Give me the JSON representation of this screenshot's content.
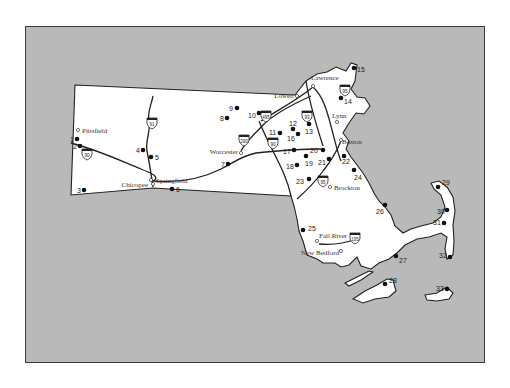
{
  "map": {
    "title": "Massachusetts",
    "colors": {
      "water": "#b9b9b9",
      "land": "#ffffff",
      "frame": "#3a3a3a",
      "marker": "#111111"
    },
    "cities": [
      {
        "name": "Pittsfield",
        "x": 77,
        "y": 129,
        "lx": 81,
        "ly": 132,
        "anchor": "start"
      },
      {
        "name": "Chicopee",
        "x": 150,
        "y": 179,
        "lx": 147,
        "ly": 186,
        "anchor": "end"
      },
      {
        "name": "Springfield",
        "x": 152,
        "y": 183,
        "lx": 155,
        "ly": 182,
        "anchor": "start"
      },
      {
        "name": "Worcester",
        "x": 240,
        "y": 152,
        "lx": 237,
        "ly": 153,
        "anchor": "end"
      },
      {
        "name": "Lowell",
        "x": 296,
        "y": 95,
        "lx": 293,
        "ly": 97,
        "anchor": "end"
      },
      {
        "name": "Lawrence",
        "x": 312,
        "y": 85,
        "lx": 310,
        "ly": 79,
        "anchor": "start"
      },
      {
        "name": "Lynn",
        "x": 336,
        "y": 121,
        "lx": 331,
        "ly": 117,
        "anchor": "start"
      },
      {
        "name": "Boston",
        "x": 340,
        "y": 139,
        "lx": 341,
        "ly": 143,
        "anchor": "start"
      },
      {
        "name": "Brockton",
        "x": 329,
        "y": 186,
        "lx": 333,
        "ly": 189,
        "anchor": "start"
      },
      {
        "name": "Fall River",
        "x": 316,
        "y": 240,
        "lx": 318,
        "ly": 237,
        "anchor": "start"
      },
      {
        "name": "New Bedford",
        "x": 340,
        "y": 250,
        "lx": 338,
        "ly": 254,
        "anchor": "end"
      }
    ],
    "sites": [
      {
        "n": "1",
        "x": 76,
        "y": 138,
        "lx": 69,
        "ly": 141
      },
      {
        "n": "2",
        "x": 79,
        "y": 145,
        "lx": 72,
        "ly": 148
      },
      {
        "n": "3",
        "x": 83,
        "y": 189,
        "lx": 76,
        "ly": 192
      },
      {
        "n": "4",
        "x": 142,
        "y": 149,
        "lx": 135,
        "ly": 152
      },
      {
        "n": "5",
        "x": 150,
        "y": 156,
        "lx": 154,
        "ly": 159
      },
      {
        "n": "6",
        "x": 171,
        "y": 188,
        "lx": 175,
        "ly": 191
      },
      {
        "n": "7",
        "x": 227,
        "y": 163,
        "lx": 220,
        "ly": 166
      },
      {
        "n": "8",
        "x": 226,
        "y": 117,
        "lx": 219,
        "ly": 120
      },
      {
        "n": "9",
        "x": 236,
        "y": 107,
        "lx": 228,
        "ly": 110
      },
      {
        "n": "10",
        "x": 258,
        "y": 112,
        "lx": 247,
        "ly": 117
      },
      {
        "n": "11",
        "x": 279,
        "y": 132,
        "lx": 268,
        "ly": 134
      },
      {
        "n": "12",
        "x": 292,
        "y": 128,
        "lx": 288,
        "ly": 125
      },
      {
        "n": "13",
        "x": 308,
        "y": 123,
        "lx": 304,
        "ly": 133
      },
      {
        "n": "14",
        "x": 340,
        "y": 97,
        "lx": 343,
        "ly": 103
      },
      {
        "n": "15",
        "x": 353,
        "y": 67,
        "lx": 356,
        "ly": 71
      },
      {
        "n": "16",
        "x": 297,
        "y": 133,
        "lx": 286,
        "ly": 140
      },
      {
        "n": "17",
        "x": 293,
        "y": 149,
        "lx": 282,
        "ly": 153
      },
      {
        "n": "18",
        "x": 296,
        "y": 164,
        "lx": 285,
        "ly": 168
      },
      {
        "n": "19",
        "x": 305,
        "y": 155,
        "lx": 304,
        "ly": 165
      },
      {
        "n": "20",
        "x": 322,
        "y": 149,
        "lx": 309,
        "ly": 152
      },
      {
        "n": "21",
        "x": 328,
        "y": 158,
        "lx": 317,
        "ly": 164
      },
      {
        "n": "22",
        "x": 343,
        "y": 155,
        "lx": 341,
        "ly": 163
      },
      {
        "n": "23",
        "x": 308,
        "y": 178,
        "lx": 295,
        "ly": 183
      },
      {
        "n": "24",
        "x": 353,
        "y": 169,
        "lx": 353,
        "ly": 179
      },
      {
        "n": "25",
        "x": 302,
        "y": 229,
        "lx": 307,
        "ly": 230
      },
      {
        "n": "26",
        "x": 384,
        "y": 204,
        "lx": 375,
        "ly": 213
      },
      {
        "n": "27",
        "x": 395,
        "y": 255,
        "lx": 398,
        "ly": 262
      },
      {
        "n": "28",
        "x": 384,
        "y": 283,
        "lx": 388,
        "ly": 282
      },
      {
        "n": "29",
        "x": 437,
        "y": 186,
        "lx": 441,
        "ly": 184
      },
      {
        "n": "30",
        "x": 446,
        "y": 209,
        "lx": 436,
        "ly": 213
      },
      {
        "n": "31",
        "x": 443,
        "y": 222,
        "lx": 432,
        "ly": 224
      },
      {
        "n": "32",
        "x": 449,
        "y": 256,
        "lx": 438,
        "ly": 257
      },
      {
        "n": "33",
        "x": 446,
        "y": 288,
        "lx": 435,
        "ly": 290
      }
    ],
    "interstates": [
      {
        "num": "90",
        "x": 86,
        "y": 152
      },
      {
        "num": "91",
        "x": 151,
        "y": 121
      },
      {
        "num": "290",
        "x": 243,
        "y": 138
      },
      {
        "num": "90",
        "x": 272,
        "y": 141
      },
      {
        "num": "495",
        "x": 265,
        "y": 114
      },
      {
        "num": "93",
        "x": 306,
        "y": 114
      },
      {
        "num": "95",
        "x": 344,
        "y": 88
      },
      {
        "num": "95",
        "x": 322,
        "y": 179
      },
      {
        "num": "195",
        "x": 354,
        "y": 236
      }
    ]
  }
}
